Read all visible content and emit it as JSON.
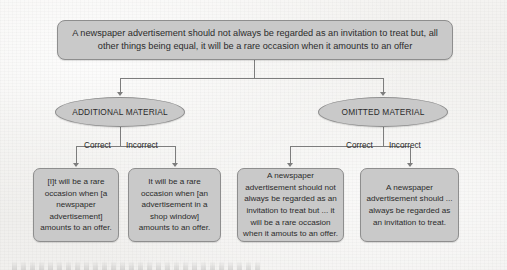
{
  "figure": {
    "type": "flowchart",
    "root": {
      "label": "A newspaper advertisement should not always be regarded as an invitation to treat but, all other things being equal, it will be a rare occasion when it amounts to an offer"
    },
    "branches": [
      {
        "name": "additional-material",
        "label": "ADDITIONAL MATERIAL",
        "children": [
          {
            "edge_label": "Correct",
            "text": "[I]t will be a rare occasion when [a newspaper advertisement] amounts to an offer."
          },
          {
            "edge_label": "Incorrect",
            "text": "It will be a rare occasion when [an advertisement in a shop window] amounts to an offer."
          }
        ]
      },
      {
        "name": "omitted-material",
        "label": "OMITTED MATERIAL",
        "children": [
          {
            "edge_label": "Correct",
            "text": "A newspaper advertisement should not always be regarded as an invitation to treat but ... it will be a rare occasion when it amouts to an offer."
          },
          {
            "edge_label": "Incorrect",
            "text": "A newspaper advertisement should ... always be regarded as an invitation to treat."
          }
        ]
      }
    ],
    "colors": {
      "node_fill": "#c9c9c9",
      "node_border": "#8e8e8e",
      "connector": "#7d7d7d",
      "text": "#2b2b2b",
      "background": "#f1f0ee"
    }
  }
}
